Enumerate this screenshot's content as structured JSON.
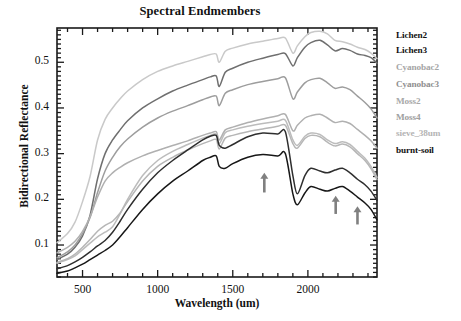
{
  "chart_data": {
    "type": "line",
    "title": "Spectral Endmembers",
    "xlabel": "Wavelength (um)",
    "ylabel": "Bidirectional Reflectance",
    "xlim": [
      330,
      2460
    ],
    "ylim": [
      0.03,
      0.575
    ],
    "xticks": [
      500,
      1000,
      1500,
      2000
    ],
    "yticks": [
      0.1,
      0.2,
      0.3,
      0.4,
      0.5
    ],
    "ytick_labels": [
      "0.1",
      "0.2",
      "0.3",
      "0.4",
      "0.5"
    ],
    "xtick_labels": [
      "500",
      "1000",
      "1500",
      "2000"
    ],
    "grid": false,
    "legend_position": "right-outside",
    "x": [
      330,
      400,
      450,
      500,
      550,
      600,
      650,
      700,
      750,
      800,
      900,
      1000,
      1100,
      1200,
      1300,
      1350,
      1390,
      1410,
      1450,
      1500,
      1600,
      1700,
      1800,
      1850,
      1900,
      1930,
      1980,
      2020,
      2080,
      2130,
      2180,
      2230,
      2280,
      2330,
      2380,
      2420,
      2460
    ],
    "series": [
      {
        "name": "Lichen2",
        "color": "#c9c9c9",
        "values": [
          0.105,
          0.125,
          0.15,
          0.195,
          0.25,
          0.33,
          0.375,
          0.4,
          0.42,
          0.437,
          0.462,
          0.48,
          0.492,
          0.502,
          0.512,
          0.517,
          0.518,
          0.5,
          0.524,
          0.531,
          0.54,
          0.546,
          0.552,
          0.553,
          0.52,
          0.536,
          0.556,
          0.565,
          0.568,
          0.562,
          0.548,
          0.545,
          0.54,
          0.533,
          0.528,
          0.52,
          0.508
        ]
      },
      {
        "name": "Lichen3",
        "color": "#6f6f6f",
        "values": [
          0.068,
          0.08,
          0.095,
          0.12,
          0.165,
          0.245,
          0.3,
          0.33,
          0.352,
          0.372,
          0.4,
          0.42,
          0.437,
          0.45,
          0.462,
          0.468,
          0.47,
          0.447,
          0.478,
          0.487,
          0.5,
          0.509,
          0.517,
          0.519,
          0.492,
          0.51,
          0.533,
          0.543,
          0.548,
          0.538,
          0.525,
          0.53,
          0.526,
          0.518,
          0.515,
          0.51,
          0.498
        ]
      },
      {
        "name": "Cyanobac2",
        "color": "#9d9d9d",
        "values": [
          0.072,
          0.085,
          0.1,
          0.125,
          0.16,
          0.215,
          0.262,
          0.292,
          0.315,
          0.332,
          0.358,
          0.378,
          0.393,
          0.405,
          0.418,
          0.424,
          0.426,
          0.405,
          0.432,
          0.44,
          0.451,
          0.458,
          0.464,
          0.466,
          0.42,
          0.435,
          0.455,
          0.462,
          0.465,
          0.455,
          0.443,
          0.446,
          0.44,
          0.426,
          0.412,
          0.398,
          0.378
        ]
      },
      {
        "name": "Cyanobac3",
        "color": "#b0b0b0",
        "values": [
          0.083,
          0.095,
          0.108,
          0.13,
          0.162,
          0.205,
          0.24,
          0.258,
          0.27,
          0.28,
          0.295,
          0.307,
          0.318,
          0.328,
          0.34,
          0.345,
          0.348,
          0.33,
          0.352,
          0.358,
          0.368,
          0.376,
          0.383,
          0.386,
          0.35,
          0.362,
          0.378,
          0.383,
          0.386,
          0.378,
          0.368,
          0.371,
          0.366,
          0.353,
          0.34,
          0.328,
          0.312
        ]
      },
      {
        "name": "Moss2",
        "color": "#bcbcbc",
        "values": [
          0.06,
          0.068,
          0.076,
          0.09,
          0.104,
          0.118,
          0.128,
          0.14,
          0.168,
          0.2,
          0.252,
          0.285,
          0.305,
          0.32,
          0.334,
          0.34,
          0.343,
          0.322,
          0.346,
          0.352,
          0.36,
          0.366,
          0.371,
          0.373,
          0.33,
          0.318,
          0.338,
          0.345,
          0.342,
          0.33,
          0.322,
          0.326,
          0.32,
          0.305,
          0.29,
          0.272,
          0.248
        ]
      },
      {
        "name": "Moss4",
        "color": "#b6b6b6",
        "values": [
          0.062,
          0.07,
          0.08,
          0.095,
          0.112,
          0.13,
          0.143,
          0.152,
          0.17,
          0.195,
          0.24,
          0.272,
          0.292,
          0.308,
          0.322,
          0.328,
          0.331,
          0.31,
          0.334,
          0.34,
          0.348,
          0.354,
          0.36,
          0.362,
          0.322,
          0.312,
          0.333,
          0.34,
          0.337,
          0.325,
          0.317,
          0.321,
          0.315,
          0.3,
          0.285,
          0.267,
          0.243
        ]
      },
      {
        "name": "sieve_38um",
        "color": "#2f2f2f",
        "values": [
          0.048,
          0.055,
          0.063,
          0.073,
          0.085,
          0.098,
          0.11,
          0.128,
          0.152,
          0.178,
          0.222,
          0.258,
          0.285,
          0.308,
          0.33,
          0.338,
          0.34,
          0.318,
          0.312,
          0.32,
          0.337,
          0.345,
          0.343,
          0.348,
          0.252,
          0.212,
          0.252,
          0.268,
          0.262,
          0.258,
          0.264,
          0.268,
          0.258,
          0.244,
          0.232,
          0.218,
          0.198
        ]
      },
      {
        "name": "burnt-soil",
        "color": "#171717",
        "values": [
          0.038,
          0.043,
          0.05,
          0.058,
          0.068,
          0.078,
          0.088,
          0.1,
          0.118,
          0.138,
          0.178,
          0.212,
          0.24,
          0.262,
          0.285,
          0.292,
          0.295,
          0.272,
          0.268,
          0.278,
          0.292,
          0.298,
          0.295,
          0.3,
          0.212,
          0.188,
          0.214,
          0.228,
          0.222,
          0.218,
          0.224,
          0.228,
          0.218,
          0.205,
          0.192,
          0.178,
          0.155
        ]
      }
    ],
    "annotations": [
      {
        "type": "arrow",
        "label": "arrow-1700nm",
        "x": 1710,
        "y_tip": 0.258,
        "y_tail": 0.215,
        "color": "#808080"
      },
      {
        "type": "arrow",
        "label": "arrow-2180nm",
        "x": 2185,
        "y_tip": 0.208,
        "y_tail": 0.168,
        "color": "#808080"
      },
      {
        "type": "arrow",
        "label": "arrow-2320nm",
        "x": 2330,
        "y_tip": 0.185,
        "y_tail": 0.145,
        "color": "#808080"
      }
    ]
  },
  "legend": {
    "entries": [
      {
        "label": "Lichen2",
        "color": "#111111"
      },
      {
        "label": "Lichen3",
        "color": "#111111"
      },
      {
        "label": "Cyanobac2",
        "color": "#a5a5a5"
      },
      {
        "label": "Cyanobac3",
        "color": "#8f8f8f"
      },
      {
        "label": "Moss2",
        "color": "#a8a8a8"
      },
      {
        "label": "Moss4",
        "color": "#a0a0a0"
      },
      {
        "label": "sieve_38um",
        "color": "#b4b4b4"
      },
      {
        "label": "burnt-soil",
        "color": "#111111"
      }
    ]
  }
}
